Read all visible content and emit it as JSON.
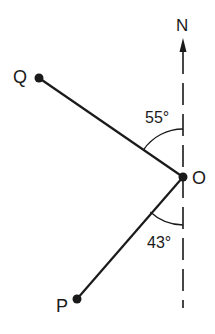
{
  "diagram": {
    "type": "bearing-diagram",
    "north_label": "N",
    "points": {
      "O": {
        "label": "O",
        "x": 183,
        "y": 177
      },
      "Q": {
        "label": "Q",
        "x": 39,
        "y": 78
      },
      "P": {
        "label": "P",
        "x": 77,
        "y": 299
      }
    },
    "angles": {
      "north_to_OQ": {
        "label": "55°",
        "value": 55
      },
      "south_to_OP": {
        "label": "43°",
        "value": 43
      }
    },
    "colors": {
      "ink": "#1a1a1a",
      "background": "#ffffff"
    }
  }
}
